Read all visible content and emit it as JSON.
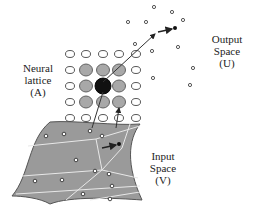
{
  "labels": {
    "neural_lattice": [
      "Neural",
      "lattice",
      "(A)"
    ],
    "output_space": [
      "Output",
      "Space",
      "(U)"
    ],
    "input_space": [
      "Input",
      "Space",
      "(V)"
    ]
  },
  "colors": {
    "surface_fill": "#9a9a9a",
    "surface_edge": "#555555",
    "partition_lines": "#e8e8e8",
    "neighbor_node": "#a8a8a8",
    "winner_node": "#111111",
    "empty_node": "#ffffff",
    "stroke": "#333333"
  },
  "lattice": {
    "columns": [
      70,
      86,
      103,
      119,
      136
    ],
    "rows": [
      54,
      70,
      86,
      102,
      118
    ],
    "node_states": [
      [
        "empty",
        "empty",
        "empty",
        "empty",
        "empty"
      ],
      [
        "empty",
        "neighbor",
        "neighbor",
        "neighbor",
        "empty"
      ],
      [
        "empty",
        "neighbor",
        "winner",
        "neighbor",
        "empty"
      ],
      [
        "empty",
        "neighbor",
        "neighbor",
        "neighbor",
        "empty"
      ],
      [
        "empty",
        "empty",
        "empty",
        "empty",
        "empty"
      ]
    ]
  },
  "output_points": [
    [
      128,
      22
    ],
    [
      146,
      22
    ],
    [
      172,
      12
    ],
    [
      183,
      20
    ],
    [
      135,
      44
    ],
    [
      152,
      51
    ],
    [
      178,
      47
    ],
    [
      193,
      68
    ],
    [
      153,
      78
    ],
    [
      190,
      85
    ],
    [
      154,
      7
    ]
  ],
  "output_vector": {
    "from": [
      157,
      32
    ],
    "to": [
      175,
      29
    ]
  },
  "input_points": [
    [
      46,
      136
    ],
    [
      64,
      134
    ],
    [
      90,
      131
    ],
    [
      102,
      136
    ],
    [
      76,
      160
    ],
    [
      95,
      171
    ],
    [
      62,
      180
    ],
    [
      35,
      181
    ],
    [
      109,
      174
    ],
    [
      112,
      186
    ],
    [
      83,
      194
    ],
    [
      110,
      199
    ]
  ],
  "input_vector": {
    "from": [
      102,
      148
    ],
    "to": [
      118,
      145
    ]
  }
}
